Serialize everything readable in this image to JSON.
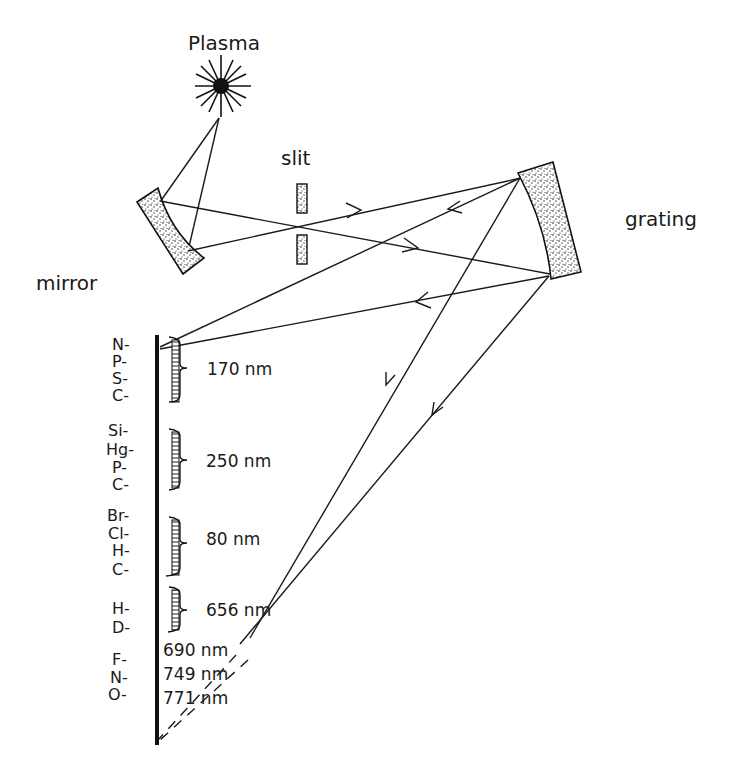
{
  "diagram": {
    "type": "optical spectrometer schematic",
    "components": {
      "source": "Plasma",
      "slit": "slit",
      "mirror": "mirror",
      "grating": "grating"
    },
    "detector_elements": [
      {
        "label": "N-"
      },
      {
        "label": "P-"
      },
      {
        "label": "S-"
      },
      {
        "label": "C-"
      },
      {
        "label": "Si-"
      },
      {
        "label": "Hg-"
      },
      {
        "label": "P-"
      },
      {
        "label": "C-"
      },
      {
        "label": "Br-"
      },
      {
        "label": "Cl-"
      },
      {
        "label": "H-"
      },
      {
        "label": "C-"
      },
      {
        "label": "H-"
      },
      {
        "label": "D-"
      },
      {
        "label": "F-"
      },
      {
        "label": "N-"
      },
      {
        "label": "O-"
      }
    ],
    "wavelength_groups": [
      {
        "label": "170 nm"
      },
      {
        "label": "250 nm"
      },
      {
        "label": "80 nm"
      },
      {
        "label": "656 nm"
      },
      {
        "label": "690 nm"
      },
      {
        "label": "749 nm"
      },
      {
        "label": "771 nm"
      }
    ]
  }
}
